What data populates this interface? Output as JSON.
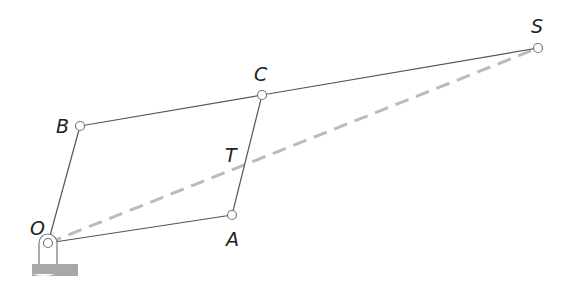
{
  "diagram": {
    "type": "linkage",
    "labels": {
      "O": "O",
      "A": "A",
      "B": "B",
      "C": "C",
      "T": "T",
      "S": "S"
    },
    "points": {
      "O": [
        48,
        243
      ],
      "A": [
        232,
        215
      ],
      "B": [
        80,
        126
      ],
      "C": [
        262,
        95
      ],
      "S": [
        538,
        48
      ]
    },
    "links": [
      [
        "O",
        "A"
      ],
      [
        "O",
        "B"
      ],
      [
        "A",
        "C"
      ],
      [
        "B",
        "C"
      ],
      [
        "C",
        "S"
      ]
    ],
    "dashed_line": [
      "O",
      "S"
    ],
    "colors": {
      "link": "#555555",
      "dashed": "#bbbbbb",
      "joint_fill": "#ffffff",
      "joint_stroke": "#777777",
      "ground": "#999999"
    }
  }
}
